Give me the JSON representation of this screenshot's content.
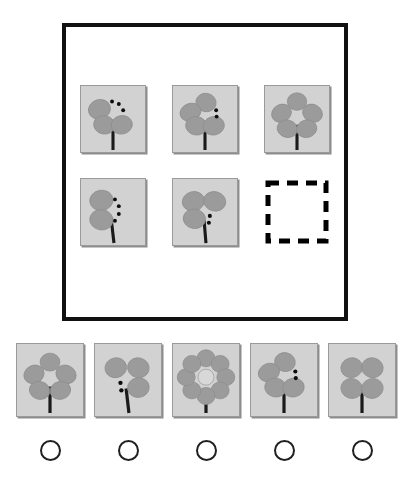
{
  "puzzle": {
    "type": "visual-analogy-matrix",
    "title": "Flower petal matrix reasoning puzzle",
    "matrix": {
      "rows": 2,
      "columns": 3,
      "cells": [
        {
          "id": "cell-1",
          "position": "row1-col1",
          "petals": 3,
          "dots": 3,
          "dot_side": "upper-right",
          "state": "filled",
          "label": "three petals with three dots"
        },
        {
          "id": "cell-2",
          "position": "row1-col2",
          "petals": 4,
          "dots": 2,
          "dot_side": "right",
          "state": "filled",
          "label": "four petals with two dots"
        },
        {
          "id": "cell-3",
          "position": "row1-col3",
          "petals": 5,
          "dots": 0,
          "dot_side": "none",
          "state": "filled",
          "label": "five petals no dots"
        },
        {
          "id": "cell-4",
          "position": "row2-col1",
          "petals": 2,
          "dots": 4,
          "dot_side": "right",
          "state": "filled",
          "label": "two petals with four dots"
        },
        {
          "id": "cell-5",
          "position": "row2-col2",
          "petals": 3,
          "dots": 2,
          "dot_side": "lower-right",
          "state": "filled",
          "label": "three petals with two dots"
        },
        {
          "id": "cell-6",
          "position": "row2-col3",
          "petals": 0,
          "dots": 0,
          "dot_side": "none",
          "state": "missing",
          "label": "missing answer cell"
        }
      ]
    },
    "options": {
      "count": 5,
      "selected": null,
      "items": [
        {
          "id": "option-1",
          "number": "1",
          "petals": 5,
          "dots": 0,
          "dot_side": "none",
          "selected": false,
          "label": "five petals no dots"
        },
        {
          "id": "option-2",
          "number": "2",
          "petals": 3,
          "dots": 2,
          "dot_side": "lower-left",
          "selected": false,
          "label": "three petals with two dots on left"
        },
        {
          "id": "option-3",
          "number": "3",
          "petals": 8,
          "dots": 0,
          "dot_side": "none",
          "selected": false,
          "label": "eight petals no dots"
        },
        {
          "id": "option-4",
          "number": "4",
          "petals": 4,
          "dots": 2,
          "dot_side": "right",
          "selected": false,
          "label": "four petals with two dots"
        },
        {
          "id": "option-5",
          "number": "5",
          "petals": 4,
          "dots": 0,
          "dot_side": "none",
          "selected": false,
          "label": "four petals no dots"
        }
      ]
    },
    "colors": {
      "page_background": "#ffffff",
      "frame_border": "#111111",
      "tile_background": "#d2d2d2",
      "tile_border": "#9a9a9a",
      "petal_fill": "#9b9b9b",
      "petal_edge": "#8a8a8a",
      "stem": "#1a1a1a",
      "dot": "#0d0d0d",
      "radio_border": "#231f20",
      "dashed_border": "#000000"
    }
  }
}
